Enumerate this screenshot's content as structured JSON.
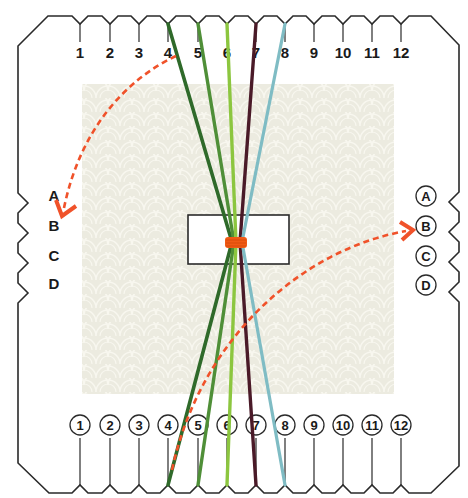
{
  "diagram": {
    "type": "kumihimo-square-plate-setup",
    "colors": {
      "outline": "#2a2a2a",
      "background": "#ffffff",
      "texture_panel": "#ecebe0",
      "texture_pattern": "#f7f6ee",
      "arrow": "#f0522a",
      "binding": "#f05a14",
      "center_slot": "#ffffff"
    },
    "top_labels": [
      "1",
      "2",
      "3",
      "4",
      "5",
      "6",
      "7",
      "8",
      "9",
      "10",
      "11",
      "12"
    ],
    "bottom_labels": [
      "1",
      "2",
      "3",
      "4",
      "5",
      "6",
      "7",
      "8",
      "9",
      "10",
      "11",
      "12"
    ],
    "left_labels": [
      "A",
      "B",
      "C",
      "D"
    ],
    "right_labels": [
      "A",
      "B",
      "C",
      "D"
    ],
    "threads": [
      {
        "name": "dark-green",
        "color": "#2f6a2a",
        "from_top": "4",
        "to_bottom": "4"
      },
      {
        "name": "medium-green",
        "color": "#4f8f38",
        "from_top": "5",
        "to_bottom": "5"
      },
      {
        "name": "lime-green",
        "color": "#8cc63f",
        "from_top": "6",
        "to_bottom": "6"
      },
      {
        "name": "burgundy",
        "color": "#4a1a28",
        "from_top": "7",
        "to_bottom": "7"
      },
      {
        "name": "light-blue",
        "color": "#7fbcc4",
        "from_top": "8",
        "to_bottom": "8"
      }
    ],
    "arrows": [
      {
        "name": "move-top-4-to-left-b",
        "from": "top 4",
        "to": "left B",
        "style": "dashed"
      },
      {
        "name": "move-bottom-4-to-right-b",
        "from": "bottom 4",
        "to": "right B",
        "style": "dashed"
      }
    ]
  }
}
